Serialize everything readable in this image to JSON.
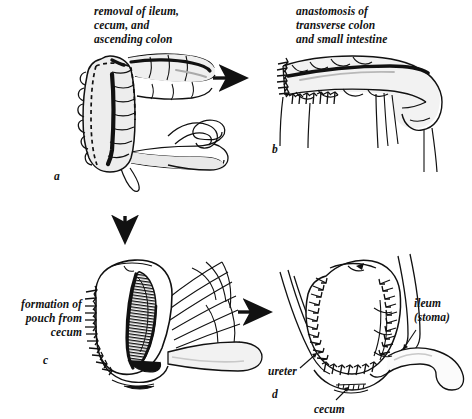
{
  "figure": {
    "background_color": "#ffffff",
    "ink_color": "#111111",
    "fill_color": "#e8e8e8"
  },
  "panels": [
    {
      "letter": "a",
      "caption": "removal of ileum,\ncecum, and\nascending colon",
      "structures": [
        "ascending colon",
        "transverse colon",
        "cecum",
        "ileum",
        "taenia coli",
        "dashed resection line"
      ]
    },
    {
      "letter": "b",
      "caption": "anastomosis of\ntransverse colon\nand small intestine",
      "structures": [
        "transverse colon",
        "small intestine",
        "anastomosis suture line",
        "mesentery"
      ]
    },
    {
      "letter": "c",
      "caption": "formation\nof pouch\nfrom cecum",
      "structures": [
        "opened cecum",
        "mucosal surface",
        "suture line",
        "mesentery",
        "ileum"
      ]
    },
    {
      "letter": "d",
      "caption": "",
      "structures": [
        "closed pouch",
        "suture lines",
        "ureters",
        "ileal stoma",
        "cecum"
      ],
      "labels": [
        {
          "name": "ileum-stoma",
          "text": "ileum\n(stoma)"
        },
        {
          "name": "ureter",
          "text": "ureter"
        },
        {
          "name": "cecum",
          "text": "cecum"
        }
      ]
    }
  ],
  "arrows": [
    {
      "name": "arrow-a-to-b",
      "direction": "right"
    },
    {
      "name": "arrow-a-to-c",
      "direction": "down"
    },
    {
      "name": "arrow-c-to-d",
      "direction": "right"
    }
  ]
}
